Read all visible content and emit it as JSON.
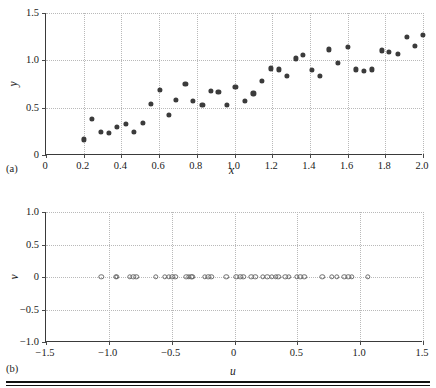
{
  "figure": {
    "panels": [
      {
        "tag": "(a)",
        "xlabel": "x",
        "ylabel": "y",
        "xticks": [
          "0",
          "0.2",
          "0.4",
          "0.6",
          "0.8",
          "1.0",
          "1.2",
          "1.4",
          "1.6",
          "1.8",
          "2.0"
        ],
        "yticks": [
          "0",
          "0.5",
          "1.0",
          "1.5"
        ]
      },
      {
        "tag": "(b)",
        "xlabel": "u",
        "ylabel": "v",
        "xticks": [
          "−1.5",
          "−1.0",
          "−0.5",
          "0",
          "0.5",
          "1.0",
          "1.5"
        ],
        "yticks": [
          "−1.0",
          "−0.5",
          "0",
          "0.5",
          "1.0"
        ]
      }
    ]
  },
  "chart_data": [
    {
      "type": "scatter",
      "panel": "(a)",
      "title": "",
      "xlabel": "x",
      "ylabel": "y",
      "xlim": [
        0,
        2.0
      ],
      "ylim": [
        0,
        1.5
      ],
      "xticks": [
        0,
        0.2,
        0.4,
        0.6,
        0.8,
        1.0,
        1.2,
        1.4,
        1.6,
        1.8,
        2.0
      ],
      "yticks": [
        0,
        0.5,
        1.0,
        1.5
      ],
      "grid": true,
      "legend": "none",
      "marker": "filled-circle",
      "marker_color": "#3b3b3b",
      "x": [
        0.2,
        0.245,
        0.29,
        0.335,
        0.375,
        0.425,
        0.465,
        0.515,
        0.555,
        0.605,
        0.65,
        0.69,
        0.74,
        0.78,
        0.83,
        0.875,
        0.915,
        0.96,
        1.005,
        1.055,
        1.1,
        1.145,
        1.195,
        1.235,
        1.28,
        1.325,
        1.365,
        1.41,
        1.455,
        1.5,
        1.55,
        1.6,
        1.645,
        1.685,
        1.73,
        1.78,
        1.82,
        1.865,
        1.915,
        1.955,
        2.0
      ],
      "y": [
        0.165,
        0.38,
        0.245,
        0.23,
        0.295,
        0.325,
        0.24,
        0.34,
        0.54,
        0.69,
        0.425,
        0.585,
        0.755,
        0.575,
        0.525,
        0.675,
        0.67,
        0.525,
        0.72,
        0.575,
        0.65,
        0.78,
        0.915,
        0.905,
        0.835,
        1.02,
        1.055,
        0.895,
        0.835,
        1.115,
        0.975,
        1.14,
        0.905,
        0.885,
        0.905,
        1.105,
        1.085,
        1.07,
        1.25,
        1.15,
        1.27
      ]
    },
    {
      "type": "scatter",
      "panel": "(b)",
      "title": "",
      "xlabel": "u",
      "ylabel": "v",
      "xlim": [
        -1.5,
        1.5
      ],
      "ylim": [
        -1.0,
        1.0
      ],
      "xticks": [
        -1.5,
        -1.0,
        -0.5,
        0,
        0.5,
        1.0,
        1.5
      ],
      "yticks": [
        -1.0,
        -0.5,
        0,
        0.5,
        1.0
      ],
      "grid": true,
      "legend": "none",
      "marker": "open-circle",
      "marker_color": "#6d6d6d",
      "x": [
        -1.06,
        -0.945,
        -0.935,
        -0.835,
        -0.805,
        -0.78,
        -0.625,
        -0.555,
        -0.525,
        -0.495,
        -0.47,
        -0.385,
        -0.365,
        -0.345,
        -0.335,
        -0.235,
        -0.21,
        -0.185,
        -0.065,
        0.015,
        0.045,
        0.07,
        0.135,
        0.165,
        0.225,
        0.26,
        0.295,
        0.33,
        0.35,
        0.405,
        0.43,
        0.495,
        0.525,
        0.555,
        0.7,
        0.775,
        0.815,
        0.875,
        0.905,
        0.935,
        1.06
      ],
      "y": [
        0,
        0,
        0,
        0,
        0,
        0,
        0,
        0,
        0,
        0,
        0,
        0,
        0,
        0,
        0,
        0,
        0,
        0,
        0,
        0,
        0,
        0,
        0,
        0,
        0,
        0,
        0,
        0,
        0,
        0,
        0,
        0,
        0,
        0,
        0,
        0,
        0,
        0,
        0,
        0,
        0
      ]
    }
  ]
}
